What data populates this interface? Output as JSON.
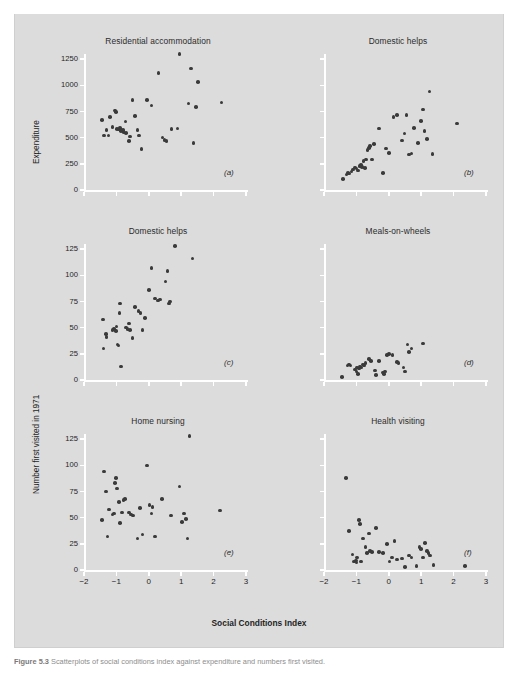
{
  "figure": {
    "axis_title_x": "Social Conditions Index",
    "axis_title_y_top": "Expenditure",
    "axis_title_y_bottom": "Number first visited in 1971",
    "caption_prefix": "Figure 5.3",
    "caption_text": "Scatterplots of social conditions index against expenditure and numbers first visited."
  },
  "colors": {
    "background": "#dcdcdc",
    "page": "#ffffff",
    "axis": "#ffffff",
    "dot": "#3a3a3a",
    "text": "#1f1f1f"
  },
  "chart_data": [
    {
      "type": "scatter",
      "panel": "(a)",
      "title": "Residential accommodation",
      "xlabel": "Social Conditions Index",
      "ylabel": "Expenditure",
      "xlim": [
        -2,
        3
      ],
      "ylim": [
        0,
        1300
      ],
      "xticks": [
        -2,
        -1,
        0,
        1,
        2,
        3
      ],
      "xticklabels": [
        "",
        "",
        "",
        "",
        "",
        ""
      ],
      "yticks": [
        0,
        250,
        500,
        750,
        1000,
        1250
      ],
      "yticklabels": [
        "0",
        "250",
        "500",
        "750",
        "1000",
        "1250"
      ],
      "grid": false,
      "legend": "none",
      "points": [
        [
          -1.45,
          670
        ],
        [
          -1.38,
          520
        ],
        [
          -1.3,
          575
        ],
        [
          -1.25,
          522
        ],
        [
          -1.2,
          700
        ],
        [
          -1.12,
          600
        ],
        [
          -1.05,
          760
        ],
        [
          -1.02,
          745
        ],
        [
          -0.98,
          585
        ],
        [
          -0.92,
          578
        ],
        [
          -0.88,
          590
        ],
        [
          -0.85,
          565
        ],
        [
          -0.8,
          572
        ],
        [
          -0.78,
          556
        ],
        [
          -0.72,
          655
        ],
        [
          -0.7,
          545
        ],
        [
          -0.62,
          470
        ],
        [
          -0.58,
          512
        ],
        [
          -0.5,
          860
        ],
        [
          -0.42,
          705
        ],
        [
          -0.35,
          575
        ],
        [
          -0.3,
          520
        ],
        [
          -0.22,
          390
        ],
        [
          -0.05,
          860
        ],
        [
          0.08,
          808
        ],
        [
          0.3,
          1120
        ],
        [
          0.42,
          500
        ],
        [
          0.48,
          478
        ],
        [
          0.55,
          470
        ],
        [
          0.7,
          585
        ],
        [
          0.88,
          588
        ],
        [
          0.95,
          1300
        ],
        [
          1.22,
          825
        ],
        [
          1.3,
          1160
        ],
        [
          1.38,
          450
        ],
        [
          1.45,
          795
        ],
        [
          1.52,
          1030
        ],
        [
          2.25,
          838
        ]
      ]
    },
    {
      "type": "scatter",
      "panel": "(b)",
      "title": "Domestic helps",
      "xlabel": "Social Conditions Index",
      "ylabel": "Expenditure",
      "xlim": [
        -2,
        3
      ],
      "ylim": [
        0,
        1300
      ],
      "xticks": [
        -2,
        -1,
        0,
        1,
        2,
        3
      ],
      "xticklabels": [
        "",
        "",
        "",
        "",
        "",
        ""
      ],
      "yticks": [
        0,
        250,
        500,
        750,
        1000,
        1250
      ],
      "yticklabels": [
        "",
        "",
        "",
        "",
        "",
        ""
      ],
      "grid": false,
      "legend": "none",
      "points": [
        [
          -1.42,
          105
        ],
        [
          -1.3,
          150
        ],
        [
          -1.26,
          165
        ],
        [
          -1.22,
          158
        ],
        [
          -1.15,
          175
        ],
        [
          -1.1,
          195
        ],
        [
          -1.05,
          215
        ],
        [
          -1.0,
          205
        ],
        [
          -0.95,
          188
        ],
        [
          -0.9,
          230
        ],
        [
          -0.86,
          240
        ],
        [
          -0.82,
          222
        ],
        [
          -0.78,
          275
        ],
        [
          -0.74,
          212
        ],
        [
          -0.7,
          290
        ],
        [
          -0.66,
          382
        ],
        [
          -0.62,
          400
        ],
        [
          -0.58,
          420
        ],
        [
          -0.52,
          290
        ],
        [
          -0.46,
          440
        ],
        [
          -0.3,
          588
        ],
        [
          -0.18,
          165
        ],
        [
          -0.08,
          398
        ],
        [
          0.0,
          352
        ],
        [
          0.15,
          700
        ],
        [
          0.25,
          718
        ],
        [
          0.4,
          472
        ],
        [
          0.48,
          540
        ],
        [
          0.55,
          718
        ],
        [
          0.62,
          338
        ],
        [
          0.7,
          350
        ],
        [
          0.78,
          592
        ],
        [
          0.9,
          450
        ],
        [
          1.0,
          660
        ],
        [
          1.05,
          770
        ],
        [
          1.1,
          565
        ],
        [
          1.18,
          490
        ],
        [
          1.25,
          940
        ],
        [
          1.35,
          345
        ],
        [
          2.1,
          635
        ]
      ]
    },
    {
      "type": "scatter",
      "panel": "(c)",
      "title": "Domestic helps",
      "xlabel": "Social Conditions Index",
      "ylabel": "Number first visited in 1971",
      "xlim": [
        -2,
        3
      ],
      "ylim": [
        0,
        130
      ],
      "xticks": [
        -2,
        -1,
        0,
        1,
        2,
        3
      ],
      "xticklabels": [
        "",
        "",
        "",
        "",
        "",
        ""
      ],
      "yticks": [
        0,
        25,
        50,
        75,
        100,
        125
      ],
      "yticklabels": [
        "0",
        "25",
        "50",
        "75",
        "100",
        "125"
      ],
      "grid": false,
      "legend": "none",
      "points": [
        [
          -1.42,
          58
        ],
        [
          -1.4,
          30
        ],
        [
          -1.32,
          44
        ],
        [
          -1.3,
          41
        ],
        [
          -1.12,
          48
        ],
        [
          -1.08,
          49
        ],
        [
          -1.02,
          47
        ],
        [
          -1.0,
          51
        ],
        [
          -0.96,
          34
        ],
        [
          -0.94,
          33
        ],
        [
          -0.9,
          64
        ],
        [
          -0.88,
          73
        ],
        [
          -0.85,
          13
        ],
        [
          -0.7,
          50
        ],
        [
          -0.66,
          49
        ],
        [
          -0.62,
          54
        ],
        [
          -0.58,
          48
        ],
        [
          -0.5,
          40
        ],
        [
          -0.42,
          70
        ],
        [
          -0.32,
          66
        ],
        [
          -0.25,
          64
        ],
        [
          -0.2,
          48
        ],
        [
          -0.12,
          59
        ],
        [
          0.0,
          86
        ],
        [
          0.08,
          107
        ],
        [
          0.2,
          78
        ],
        [
          0.28,
          76
        ],
        [
          0.35,
          77
        ],
        [
          0.52,
          94
        ],
        [
          0.58,
          104
        ],
        [
          0.62,
          73
        ],
        [
          0.66,
          75
        ],
        [
          0.8,
          128
        ],
        [
          1.35,
          116
        ]
      ]
    },
    {
      "type": "scatter",
      "panel": "(d)",
      "title": "Meals-on-wheels",
      "xlabel": "Social Conditions Index",
      "ylabel": "Number first visited in 1971",
      "xlim": [
        -2,
        3
      ],
      "ylim": [
        0,
        130
      ],
      "xticks": [
        -2,
        -1,
        0,
        1,
        2,
        3
      ],
      "xticklabels": [
        "",
        "",
        "",
        "",
        "",
        ""
      ],
      "yticks": [
        0,
        25,
        50,
        75,
        100,
        125
      ],
      "yticklabels": [
        "",
        "",
        "",
        "",
        "",
        ""
      ],
      "grid": false,
      "legend": "none",
      "points": [
        [
          -1.45,
          3
        ],
        [
          -1.28,
          14
        ],
        [
          -1.22,
          15
        ],
        [
          -1.18,
          14
        ],
        [
          -1.05,
          10
        ],
        [
          -1.0,
          8
        ],
        [
          -0.98,
          12
        ],
        [
          -0.95,
          6
        ],
        [
          -0.92,
          11
        ],
        [
          -0.88,
          13
        ],
        [
          -0.84,
          12
        ],
        [
          -0.8,
          15
        ],
        [
          -0.76,
          14
        ],
        [
          -0.72,
          16
        ],
        [
          -0.62,
          20
        ],
        [
          -0.55,
          18
        ],
        [
          -0.42,
          9
        ],
        [
          -0.4,
          5
        ],
        [
          -0.3,
          18
        ],
        [
          -0.18,
          7
        ],
        [
          -0.15,
          6
        ],
        [
          -0.12,
          8
        ],
        [
          -0.05,
          24
        ],
        [
          0.0,
          25
        ],
        [
          0.12,
          24
        ],
        [
          0.25,
          17
        ],
        [
          0.3,
          16
        ],
        [
          0.45,
          12
        ],
        [
          0.5,
          8
        ],
        [
          0.58,
          34
        ],
        [
          0.62,
          27
        ],
        [
          0.7,
          30
        ],
        [
          1.05,
          35
        ]
      ]
    },
    {
      "type": "scatter",
      "panel": "(e)",
      "title": "Home nursing",
      "xlabel": "Social Conditions Index",
      "ylabel": "Number first visited in 1971",
      "xlim": [
        -2,
        3
      ],
      "ylim": [
        0,
        130
      ],
      "xticks": [
        -2,
        -1,
        0,
        1,
        2,
        3
      ],
      "xticklabels": [
        "-2",
        "-1",
        "0",
        "1",
        "2",
        "3"
      ],
      "yticks": [
        0,
        25,
        50,
        75,
        100,
        125
      ],
      "yticklabels": [
        "0",
        "25",
        "50",
        "75",
        "100",
        "125"
      ],
      "grid": false,
      "legend": "none",
      "points": [
        [
          -1.45,
          48
        ],
        [
          -1.38,
          94
        ],
        [
          -1.32,
          75
        ],
        [
          -1.28,
          32
        ],
        [
          -1.22,
          58
        ],
        [
          -1.12,
          53
        ],
        [
          -1.08,
          54
        ],
        [
          -1.05,
          83
        ],
        [
          -1.02,
          88
        ],
        [
          -0.98,
          78
        ],
        [
          -0.92,
          65
        ],
        [
          -0.88,
          45
        ],
        [
          -0.82,
          55
        ],
        [
          -0.78,
          67
        ],
        [
          -0.74,
          68
        ],
        [
          -0.62,
          55
        ],
        [
          -0.55,
          53
        ],
        [
          -0.48,
          52
        ],
        [
          -0.35,
          30
        ],
        [
          -0.28,
          59
        ],
        [
          -0.2,
          34
        ],
        [
          -0.05,
          100
        ],
        [
          0.02,
          62
        ],
        [
          0.08,
          54
        ],
        [
          0.12,
          60
        ],
        [
          0.2,
          32
        ],
        [
          0.4,
          68
        ],
        [
          0.68,
          52
        ],
        [
          0.95,
          80
        ],
        [
          1.02,
          46
        ],
        [
          1.08,
          54
        ],
        [
          1.15,
          49
        ],
        [
          1.2,
          30
        ],
        [
          1.25,
          128
        ],
        [
          2.2,
          57
        ]
      ]
    },
    {
      "type": "scatter",
      "panel": "(f)",
      "title": "Health visiting",
      "xlabel": "Social Conditions Index",
      "ylabel": "Number first visited in 1971",
      "xlim": [
        -2,
        3
      ],
      "ylim": [
        0,
        130
      ],
      "xticks": [
        -2,
        -1,
        0,
        1,
        2,
        3
      ],
      "xticklabels": [
        "-2",
        "-1",
        "0",
        "1",
        "2",
        "3"
      ],
      "yticks": [
        0,
        25,
        50,
        75,
        100,
        125
      ],
      "yticklabels": [
        "",
        "",
        "",
        "",
        "",
        ""
      ],
      "grid": false,
      "legend": "none",
      "points": [
        [
          -1.32,
          88
        ],
        [
          -1.22,
          37
        ],
        [
          -1.12,
          15
        ],
        [
          -1.08,
          8
        ],
        [
          -1.02,
          9
        ],
        [
          -1.0,
          7
        ],
        [
          -0.98,
          12
        ],
        [
          -0.92,
          48
        ],
        [
          -0.88,
          44
        ],
        [
          -0.85,
          8
        ],
        [
          -0.8,
          30
        ],
        [
          -0.72,
          22
        ],
        [
          -0.68,
          16
        ],
        [
          -0.62,
          35
        ],
        [
          -0.58,
          18
        ],
        [
          -0.52,
          17
        ],
        [
          -0.4,
          40
        ],
        [
          -0.3,
          17
        ],
        [
          -0.18,
          16
        ],
        [
          -0.05,
          25
        ],
        [
          0.02,
          8
        ],
        [
          0.1,
          12
        ],
        [
          0.18,
          28
        ],
        [
          0.25,
          10
        ],
        [
          0.4,
          11
        ],
        [
          0.5,
          3
        ],
        [
          0.62,
          14
        ],
        [
          0.7,
          12
        ],
        [
          0.85,
          4
        ],
        [
          0.95,
          22
        ],
        [
          1.0,
          20
        ],
        [
          1.05,
          12
        ],
        [
          1.12,
          26
        ],
        [
          1.18,
          18
        ],
        [
          1.22,
          16
        ],
        [
          1.28,
          14
        ],
        [
          1.38,
          5
        ],
        [
          2.35,
          4
        ]
      ]
    }
  ]
}
